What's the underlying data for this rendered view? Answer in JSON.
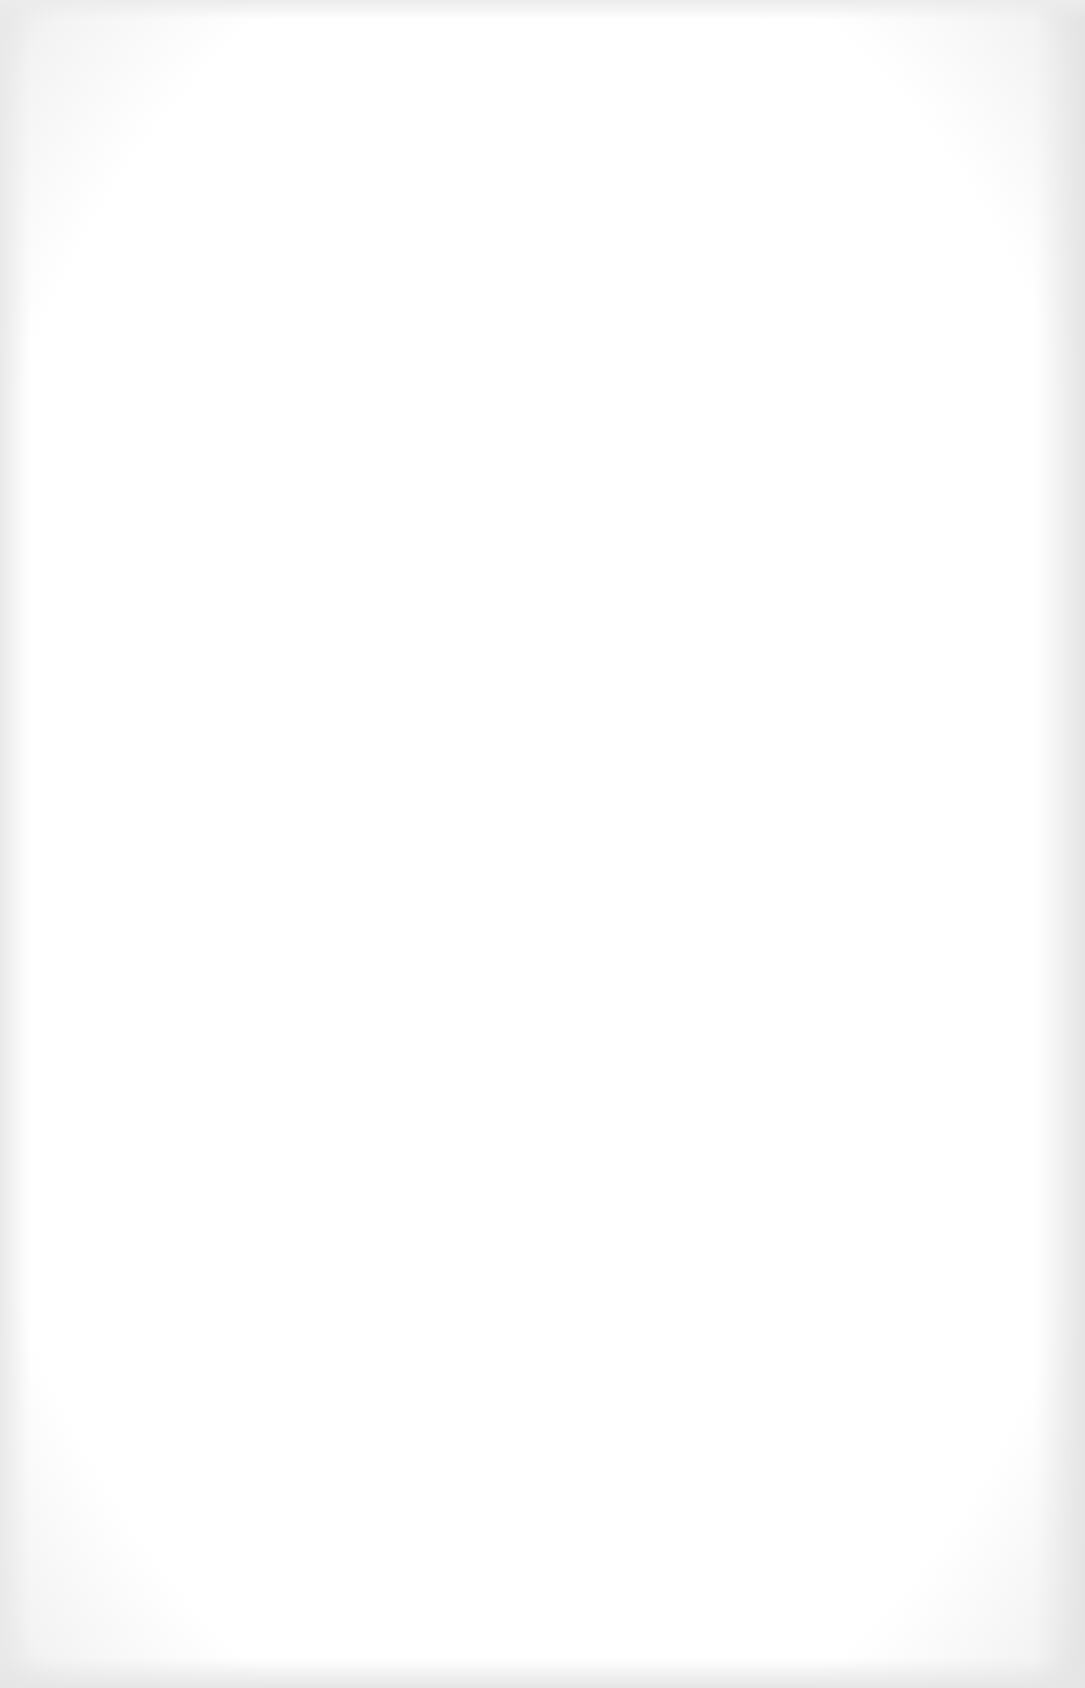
{
  "document": {
    "type": "blank-scanned-page",
    "background_color": "#ffffff",
    "edge_shade_color": "#e6e6e6",
    "bleed_through_text": {
      "header_line_1": "",
      "header_line_2": "",
      "corner_mark": "",
      "margin_marks": [
        "",
        "",
        ""
      ],
      "center_mark": ""
    }
  }
}
